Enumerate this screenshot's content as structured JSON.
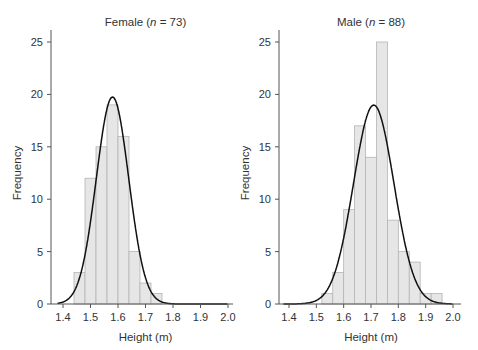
{
  "chart_data": [
    {
      "type": "bar",
      "title": "Female (n = 73)",
      "title_prefix": "Female (",
      "title_n": "n",
      "title_suffix": " = 73)",
      "xlabel": "Height (m)",
      "ylabel": "Frequency",
      "bin_width": 0.04,
      "bin_starts": [
        1.44,
        1.48,
        1.52,
        1.56,
        1.6,
        1.64,
        1.68,
        1.72
      ],
      "values": [
        3,
        12,
        15,
        19,
        16,
        5,
        2,
        1
      ],
      "normal_fit": {
        "mean": 1.58,
        "sd": 0.059,
        "n": 73
      },
      "xlim": [
        1.37,
        2.02
      ],
      "ylim": [
        0,
        26
      ],
      "xticks": [
        "1.4",
        "1.5",
        "1.6",
        "1.7",
        "1.8",
        "1.9",
        "2.0"
      ],
      "yticks": [
        "0",
        "5",
        "10",
        "15",
        "20",
        "25"
      ]
    },
    {
      "type": "bar",
      "title": "Male (n = 88)",
      "title_prefix": "Male (",
      "title_n": "n",
      "title_suffix": " = 88)",
      "xlabel": "Height (m)",
      "ylabel": "Frequency",
      "bin_width": 0.04,
      "bin_starts": [
        1.52,
        1.56,
        1.6,
        1.64,
        1.68,
        1.72,
        1.76,
        1.8,
        1.84,
        1.88,
        1.92
      ],
      "values": [
        1,
        3,
        9,
        17,
        14,
        25,
        8,
        5,
        4,
        1,
        1
      ],
      "normal_fit": {
        "mean": 1.71,
        "sd": 0.074,
        "n": 88
      },
      "xlim": [
        1.37,
        2.02
      ],
      "ylim": [
        0,
        26
      ],
      "xticks": [
        "1.4",
        "1.5",
        "1.6",
        "1.7",
        "1.8",
        "1.9",
        "2.0"
      ],
      "yticks": [
        "0",
        "5",
        "10",
        "15",
        "20",
        "25"
      ]
    }
  ]
}
